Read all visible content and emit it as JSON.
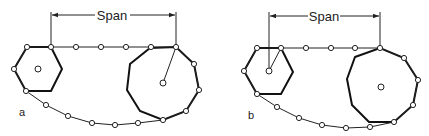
{
  "figure": {
    "panels": [
      {
        "id": "a",
        "label": "a",
        "span_label": "Span",
        "description": "Chain over small hexagonal sprocket and large nonagonal sprocket; span measured from small sprocket tangent pin to large sprocket tangent pin, radius line drawn on large sprocket"
      },
      {
        "id": "b",
        "label": "b",
        "span_label": "Span",
        "description": "Chain over small hexagonal sprocket and large nonagonal sprocket; span measured from small sprocket center to large sprocket top pin, radius line drawn on small sprocket"
      }
    ],
    "colors": {
      "line": "#222222",
      "sprocket": "#111111",
      "pin_fill": "#ffffff",
      "background": "#ffffff"
    }
  }
}
